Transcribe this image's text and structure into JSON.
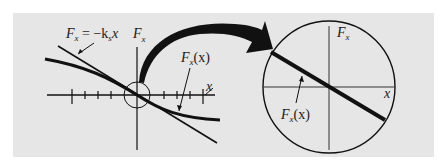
{
  "figure": {
    "background_color": "#ffffff",
    "panel_color": "#e6e6e6",
    "ink_color": "#111111",
    "left_plot": {
      "y_axis_label_main": "F",
      "y_axis_label_sub": "x",
      "x_axis_label": "x",
      "linear_label_main": "F",
      "linear_label_sub": "x",
      "linear_label_rest": " = −k",
      "linear_label_sub2": "s",
      "linear_label_tail": "x",
      "curve_label_main": "F",
      "curve_label_sub": "x",
      "curve_label_tail": "(x)",
      "tick_count_left": 5,
      "tick_count_right": 5
    },
    "right_plot": {
      "y_axis_label_main": "F",
      "y_axis_label_sub": "x",
      "x_axis_label": "x",
      "curve_label_main": "F",
      "curve_label_sub": "x",
      "curve_label_tail": "(x)"
    },
    "arrow": {
      "description": "magnify-arrow from origin circle to enlarged view"
    }
  }
}
